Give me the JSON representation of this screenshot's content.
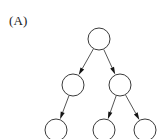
{
  "figure": {
    "panel_label": "(A)",
    "width": 168,
    "height": 139,
    "background_color": "#ffffff"
  },
  "diagram": {
    "type": "directed-tree",
    "node_stroke_color": "#3a3a3a",
    "node_fill_color": "#ffffff",
    "edge_color": "#555555",
    "arrow_color": "#141414",
    "node_radius": 11,
    "nodes": [
      {
        "id": "root",
        "label": "",
        "cx": 99,
        "cy": 39,
        "r": 11,
        "level": 0
      },
      {
        "id": "mid-l",
        "label": "",
        "cx": 73,
        "cy": 85,
        "r": 11,
        "level": 1
      },
      {
        "id": "mid-r",
        "label": "",
        "cx": 120,
        "cy": 85,
        "r": 11,
        "level": 1
      },
      {
        "id": "leaf-l",
        "label": "",
        "cx": 56,
        "cy": 130,
        "r": 11,
        "level": 2
      },
      {
        "id": "leaf-m",
        "label": "",
        "cx": 104,
        "cy": 130,
        "r": 11,
        "level": 2
      },
      {
        "id": "leaf-r",
        "label": "",
        "cx": 145,
        "cy": 130,
        "r": 11,
        "level": 2
      }
    ],
    "edges": [
      {
        "id": "e1",
        "from": "root",
        "to": "mid-l",
        "directed": true
      },
      {
        "id": "e2",
        "from": "root",
        "to": "mid-r",
        "directed": true
      },
      {
        "id": "e3",
        "from": "mid-l",
        "to": "leaf-l",
        "directed": true
      },
      {
        "id": "e4",
        "from": "mid-r",
        "to": "leaf-m",
        "directed": true
      },
      {
        "id": "e5",
        "from": "mid-r",
        "to": "leaf-r",
        "directed": true
      }
    ]
  }
}
